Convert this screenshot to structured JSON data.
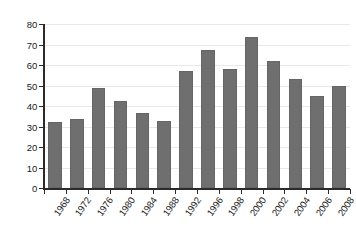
{
  "chart_data": {
    "type": "bar",
    "title": "",
    "xlabel": "",
    "ylabel": "",
    "categories": [
      "1968",
      "1972",
      "1976",
      "1980",
      "1984",
      "1988",
      "1992",
      "1996",
      "1998",
      "2000",
      "2002",
      "2004",
      "2006",
      "2008"
    ],
    "values": [
      32,
      33.5,
      49,
      42.5,
      36.5,
      32.5,
      57,
      67.5,
      58,
      73.5,
      62,
      53,
      45,
      50
    ],
    "ylim": [
      0,
      80
    ],
    "yticks": [
      0,
      10,
      20,
      30,
      40,
      50,
      60,
      70,
      80
    ],
    "ytick_labels": [
      "0",
      "10",
      "20",
      "30",
      "40",
      "50",
      "60",
      "70",
      "80"
    ],
    "grid": true,
    "legend": null,
    "bar_color": "#706f6f",
    "grid_color": "#e8e8e8",
    "axis_color": "#2b2b2b",
    "background": "#ffffff",
    "xtick_rotation": -55
  }
}
